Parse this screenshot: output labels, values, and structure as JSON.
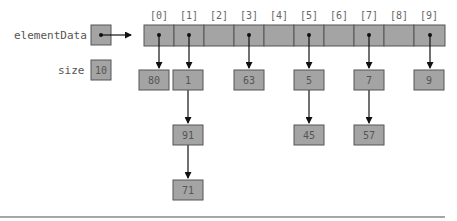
{
  "diagram": {
    "labels": {
      "elementData": "elementData",
      "size": "size"
    },
    "size_value": "10",
    "array": {
      "indices": [
        "[0]",
        "[1]",
        "[2]",
        "[3]",
        "[4]",
        "[5]",
        "[6]",
        "[7]",
        "[8]",
        "[9]"
      ],
      "cell_width": 30,
      "x": 144,
      "y": 25,
      "height": 21
    },
    "nodes": [
      {
        "id": "n80",
        "value": "80",
        "x": 139,
        "y": 70
      },
      {
        "id": "n1",
        "value": "1",
        "x": 173,
        "y": 70
      },
      {
        "id": "n91",
        "value": "91",
        "x": 173,
        "y": 125
      },
      {
        "id": "n71",
        "value": "71",
        "x": 173,
        "y": 180
      },
      {
        "id": "n63",
        "value": "63",
        "x": 234,
        "y": 70
      },
      {
        "id": "n5",
        "value": "5",
        "x": 294,
        "y": 70
      },
      {
        "id": "n45",
        "value": "45",
        "x": 294,
        "y": 125
      },
      {
        "id": "n7",
        "value": "7",
        "x": 354,
        "y": 70
      },
      {
        "id": "n57",
        "value": "57",
        "x": 354,
        "y": 125
      },
      {
        "id": "n9",
        "value": "9",
        "x": 414,
        "y": 70
      }
    ],
    "buckets": [
      {
        "index": 0,
        "chain": [
          "80"
        ]
      },
      {
        "index": 1,
        "chain": [
          "1",
          "91",
          "71"
        ]
      },
      {
        "index": 2,
        "chain": []
      },
      {
        "index": 3,
        "chain": [
          "63"
        ]
      },
      {
        "index": 4,
        "chain": []
      },
      {
        "index": 5,
        "chain": [
          "5",
          "45"
        ]
      },
      {
        "index": 6,
        "chain": []
      },
      {
        "index": 7,
        "chain": [
          "7",
          "57"
        ]
      },
      {
        "index": 8,
        "chain": []
      },
      {
        "index": 9,
        "chain": [
          "9"
        ]
      }
    ],
    "colors": {
      "box_fill": "#a4a4a4",
      "box_stroke": "#555555",
      "arrow": "#111111",
      "text": "#555555"
    }
  }
}
